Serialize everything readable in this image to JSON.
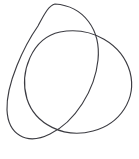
{
  "figure": {
    "background_color": "#ffffff",
    "stroke_color": "#3c3c42",
    "stroke_width": 1.15,
    "canvas": {
      "width": 139,
      "height": 159
    },
    "bounding_box": {
      "left": 7,
      "top": 4,
      "right": 131,
      "bottom": 151
    },
    "crossings": [
      {
        "name": "upper-right-crossing",
        "x": 78,
        "y": 40
      },
      {
        "name": "left-crossing",
        "x": 21,
        "y": 70
      },
      {
        "name": "lower-crossing",
        "x": 79,
        "y": 120
      }
    ],
    "loops": [
      {
        "name": "upper-left-loop",
        "center_x": 52,
        "center_y": 62,
        "radius_x": 47,
        "radius_y": 60,
        "rotation_deg": 28,
        "path": "M 55 4 C 84 6 101 30 98 60 C 95 90 75 122 50 134 C 26 146 8 134 7 110 C 6 84 24 46 38 26 C 44 15 48 6 55 4 Z"
      },
      {
        "name": "right-loop",
        "center_x": 86,
        "center_y": 78,
        "radius_x": 46,
        "radius_y": 51,
        "rotation_deg": -22,
        "path": "M 60 32 C 92 26 122 44 130 72 C 137 99 120 124 93 131 C 64 139 35 124 27 99 C 19 72 32 38 60 32 Z"
      }
    ]
  }
}
